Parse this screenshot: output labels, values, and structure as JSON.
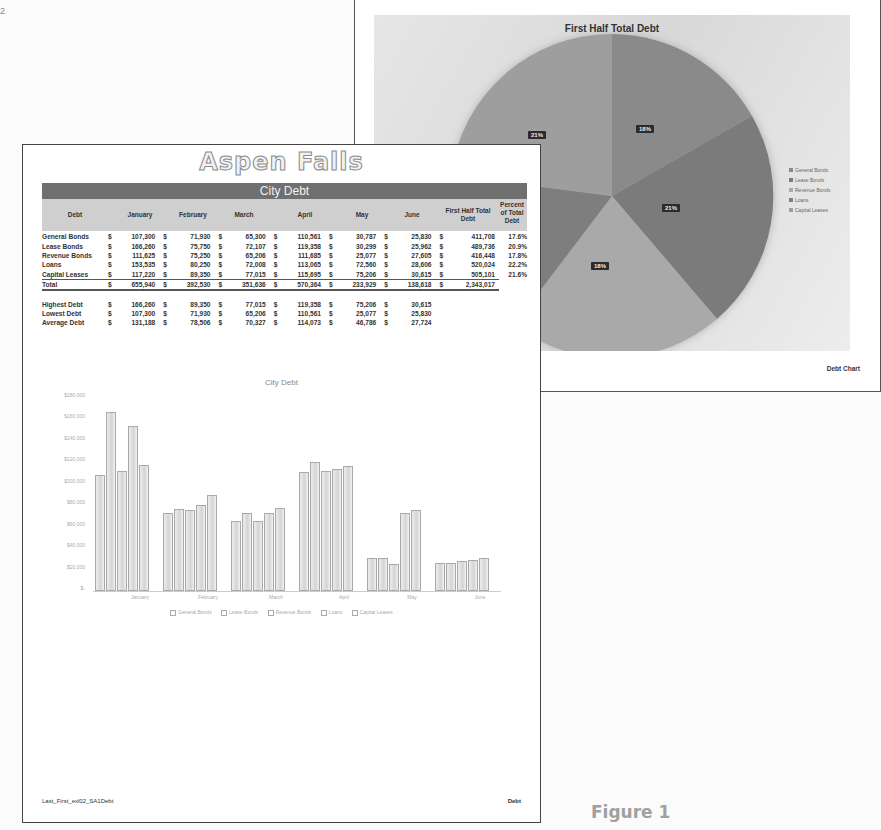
{
  "corner_mark": "2",
  "figure_label": "Figure 1",
  "back_page": {
    "footer_right": "Debt Chart",
    "pie": {
      "title": "First Half Total Debt",
      "legend": [
        "General Bonds",
        "Lease Bonds",
        "Revenue Bonds",
        "Loans",
        "Capital Leases"
      ],
      "labels": [
        "18%",
        "21%",
        "18%",
        "21%"
      ]
    }
  },
  "front_page": {
    "title": "Aspen Falls",
    "band": "City Debt",
    "headers": [
      "Debt",
      "January",
      "February",
      "March",
      "April",
      "May",
      "June",
      "First Half Total Debt",
      "Percent of Total Debt"
    ],
    "rows": [
      {
        "label": "General Bonds",
        "values": [
          "107,300",
          "71,930",
          "65,300",
          "110,561",
          "30,787",
          "25,830",
          "411,708"
        ],
        "pct": "17.6%"
      },
      {
        "label": "Lease Bonds",
        "values": [
          "166,260",
          "75,750",
          "72,107",
          "119,358",
          "30,299",
          "25,962",
          "489,736"
        ],
        "pct": "20.9%"
      },
      {
        "label": "Revenue Bonds",
        "values": [
          "111,625",
          "75,250",
          "65,206",
          "111,685",
          "25,077",
          "27,605",
          "416,448"
        ],
        "pct": "17.8%"
      },
      {
        "label": "Loans",
        "values": [
          "153,535",
          "80,250",
          "72,008",
          "113,065",
          "72,560",
          "28,606",
          "520,024"
        ],
        "pct": "22.2%"
      },
      {
        "label": "Capital Leases",
        "values": [
          "117,220",
          "89,350",
          "77,015",
          "115,695",
          "75,206",
          "30,615",
          "505,101"
        ],
        "pct": "21.6%"
      }
    ],
    "total": {
      "label": "Total",
      "values": [
        "655,940",
        "392,530",
        "351,636",
        "570,364",
        "233,929",
        "138,618",
        "2,343,017"
      ]
    },
    "stats": [
      {
        "label": "Highest Debt",
        "values": [
          "166,260",
          "89,350",
          "77,015",
          "119,358",
          "75,206",
          "30,615"
        ]
      },
      {
        "label": "Lowest Debt",
        "values": [
          "107,300",
          "71,930",
          "65,206",
          "110,561",
          "25,077",
          "25,830"
        ]
      },
      {
        "label": "Average Debt",
        "values": [
          "131,188",
          "78,506",
          "70,327",
          "114,073",
          "46,786",
          "27,724"
        ]
      }
    ],
    "currency": "$",
    "footer_left": "Last_First_exl02_SA1Debt",
    "footer_right": "Debt"
  },
  "chart_data": [
    {
      "type": "bar",
      "title": "City Debt",
      "categories": [
        "January",
        "February",
        "March",
        "April",
        "May",
        "June"
      ],
      "series": [
        {
          "name": "General Bonds",
          "values": [
            107300,
            71930,
            65300,
            110561,
            30787,
            25830
          ]
        },
        {
          "name": "Lease Bonds",
          "values": [
            166260,
            75750,
            72107,
            119358,
            30299,
            25962
          ]
        },
        {
          "name": "Revenue Bonds",
          "values": [
            111625,
            75250,
            65206,
            111685,
            25077,
            27605
          ]
        },
        {
          "name": "Loans",
          "values": [
            153535,
            80250,
            72008,
            113065,
            72560,
            28606
          ]
        },
        {
          "name": "Capital Leases",
          "values": [
            117220,
            89350,
            77015,
            115695,
            75206,
            30615
          ]
        }
      ],
      "yticks": [
        "$180,000",
        "$160,000",
        "$140,000",
        "$120,000",
        "$100,000",
        "$80,000",
        "$60,000",
        "$40,000",
        "$20,000",
        "$-"
      ],
      "ylim": [
        0,
        180000
      ],
      "legend_position": "bottom",
      "grid": false
    },
    {
      "type": "pie",
      "title": "First Half Total Debt",
      "categories": [
        "General Bonds",
        "Lease Bonds",
        "Revenue Bonds",
        "Loans",
        "Capital Leases"
      ],
      "values": [
        411708,
        489736,
        416448,
        520024,
        505101
      ],
      "percent_labels": [
        "18%",
        "21%",
        "18%",
        "22%",
        "22%"
      ],
      "legend_position": "right"
    }
  ]
}
